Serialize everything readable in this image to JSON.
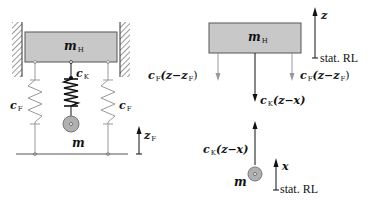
{
  "colors": {
    "mass_fill": "#c8c8c8",
    "mass_stroke": "#555555",
    "spring_gray": "#a0a0a0",
    "spring_dark": "#111111",
    "hatch": "#333333",
    "ball_fill": "#b0b0b0"
  },
  "left_diagram": {
    "mass_label": {
      "sym": "m",
      "sub": "H"
    },
    "spring_center_label": {
      "sym": "c",
      "sub": "K"
    },
    "spring_left_label": {
      "sym": "c",
      "sub": "F"
    },
    "spring_right_label": {
      "sym": "c",
      "sub": "F"
    },
    "small_mass_label": {
      "sym": "m"
    },
    "base_coord_label": {
      "sym": "z",
      "sub": "F"
    }
  },
  "right_diagram": {
    "mass_label": {
      "sym": "m",
      "sub": "H"
    },
    "z_label": {
      "sym": "z"
    },
    "stat_rl_top": "stat. RL",
    "force_left": {
      "c": "c",
      "csub": "F",
      "expr": "(z−z",
      "zsub": "F",
      "close": ")"
    },
    "force_right": {
      "c": "c",
      "csub": "F",
      "expr": "(z−z",
      "zsub": "F",
      "close": ")"
    },
    "force_center_down": {
      "c": "c",
      "csub": "K",
      "expr": "(z−x)"
    },
    "force_center_up": {
      "c": "c",
      "csub": "K",
      "expr": "(z−x)"
    },
    "small_mass_label": {
      "sym": "m"
    },
    "x_label": {
      "sym": "x"
    },
    "stat_rl_bottom": "stat. RL"
  }
}
